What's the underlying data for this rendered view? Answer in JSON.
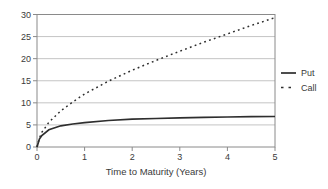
{
  "chart_data": {
    "type": "line",
    "title": "",
    "xlabel": "Time to Maturity (Years)",
    "ylabel": "",
    "xlim": [
      0,
      5
    ],
    "ylim": [
      0,
      30
    ],
    "xticks": [
      "0",
      "1",
      "2",
      "3",
      "4",
      "5"
    ],
    "yticks": [
      "0",
      "5",
      "10",
      "15",
      "20",
      "25",
      "30"
    ],
    "grid": "horizontal-only",
    "frame": "full-box",
    "legend": {
      "position": "right-outside",
      "entries": [
        {
          "label": "Put",
          "line_style": "solid"
        },
        {
          "label": "Call",
          "line_style": "dotted"
        }
      ]
    },
    "series": [
      {
        "name": "Put",
        "line_style": "solid",
        "color": "#2e2e2e",
        "x": [
          0,
          0.05,
          0.1,
          0.25,
          0.5,
          0.75,
          1.0,
          1.5,
          2.0,
          2.5,
          3.0,
          3.5,
          4.0,
          4.5,
          5.0
        ],
        "values": [
          0,
          1.8,
          2.6,
          3.9,
          4.8,
          5.2,
          5.5,
          6.0,
          6.3,
          6.45,
          6.6,
          6.7,
          6.8,
          6.85,
          6.9
        ]
      },
      {
        "name": "Call",
        "line_style": "dotted",
        "color": "#2e2e2e",
        "x": [
          0,
          0.05,
          0.1,
          0.25,
          0.5,
          0.75,
          1.0,
          1.5,
          2.0,
          2.5,
          3.0,
          3.5,
          4.0,
          4.5,
          5.0
        ],
        "values": [
          0,
          2.0,
          3.3,
          5.6,
          8.2,
          10.2,
          12.0,
          14.9,
          17.4,
          19.6,
          21.7,
          23.7,
          25.6,
          27.5,
          29.3
        ]
      }
    ],
    "colors": {
      "background": "#ffffff",
      "text": "#3a3a3a",
      "frame": "#8a8a8a",
      "gridline": "#c4c4c4",
      "line": "#2e2e2e"
    }
  }
}
